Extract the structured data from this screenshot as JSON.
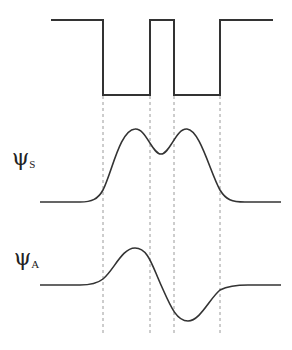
{
  "diagram": {
    "title": "",
    "potential": {
      "description": "double square well potential",
      "points": [
        [
          51,
          20
        ],
        [
          103,
          20
        ],
        [
          103,
          95
        ],
        [
          150,
          95
        ],
        [
          150,
          20
        ],
        [
          174,
          20
        ],
        [
          174,
          95
        ],
        [
          220,
          95
        ],
        [
          220,
          20
        ],
        [
          273,
          20
        ]
      ]
    },
    "dividers_x": [
      103,
      150,
      174,
      220
    ],
    "divider_y_range": [
      95,
      336
    ],
    "wavefunctions": [
      {
        "id": "symmetric",
        "symbol": "ψ",
        "subscript": "S",
        "baseline_y": 202,
        "label_x": 12,
        "label_y": 146
      },
      {
        "id": "antisymmetric",
        "symbol": "ψ",
        "subscript": "A",
        "baseline_y": 285,
        "label_x": 14,
        "label_y": 246
      }
    ],
    "colors": {
      "line": "#333333",
      "dash": "#999999"
    }
  }
}
